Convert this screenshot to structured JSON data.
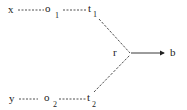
{
  "diagram": {
    "nodes": {
      "x": {
        "label": "x"
      },
      "o1": {
        "label": "o",
        "sub": "1"
      },
      "t1": {
        "label": "t",
        "sub": "1"
      },
      "y": {
        "label": "y"
      },
      "o2": {
        "label": "o",
        "sub": "2"
      },
      "t2": {
        "label": "t",
        "sub": "2"
      },
      "r": {
        "label": "r"
      },
      "b": {
        "label": "b"
      }
    },
    "edges": [
      {
        "from": "x",
        "to": "o1",
        "style": "dashed"
      },
      {
        "from": "o1",
        "to": "t1",
        "style": "dashed"
      },
      {
        "from": "t1",
        "to": "r",
        "style": "dashed"
      },
      {
        "from": "y",
        "to": "o2",
        "style": "dashed"
      },
      {
        "from": "o2",
        "to": "t2",
        "style": "dashed"
      },
      {
        "from": "t2",
        "to": "r",
        "style": "dashed"
      },
      {
        "from": "r",
        "to": "b",
        "style": "solid-arrow"
      }
    ],
    "colors": {
      "ink": "#222222",
      "background": "#ffffff"
    }
  }
}
